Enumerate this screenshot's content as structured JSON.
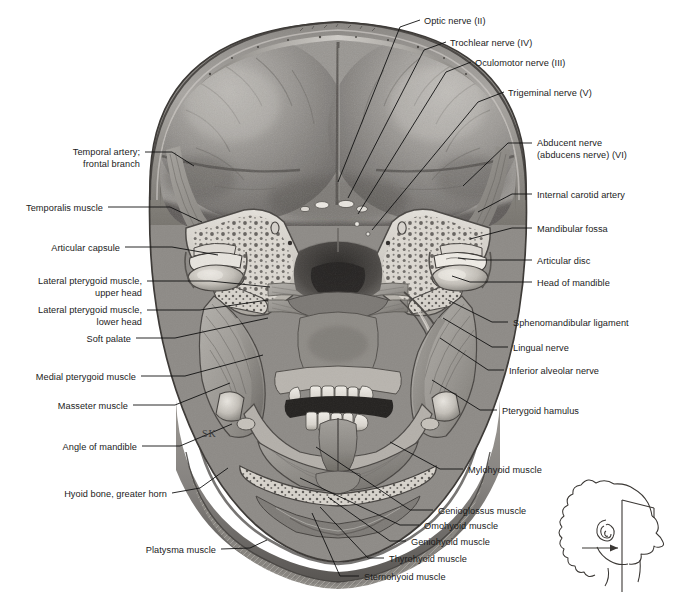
{
  "figure": {
    "background_color": "#ffffff",
    "artist_signature": "SK",
    "width": 676,
    "height": 594
  },
  "labels_left": [
    {
      "id": "temporal-artery-frontal-branch",
      "lines": [
        "Temporal artery;",
        "frontal branch"
      ],
      "text_x": 140,
      "text_y": 147,
      "leader": [
        [
          145,
          152
        ],
        [
          172,
          152
        ],
        [
          194,
          166
        ]
      ]
    },
    {
      "id": "temporalis-muscle",
      "lines": [
        "Temporalis muscle"
      ],
      "text_x": 103,
      "text_y": 203,
      "leader": [
        [
          108,
          207
        ],
        [
          170,
          207
        ],
        [
          202,
          222
        ]
      ]
    },
    {
      "id": "articular-capsule",
      "lines": [
        "Articular capsule"
      ],
      "text_x": 120,
      "text_y": 243,
      "leader": [
        [
          125,
          247
        ],
        [
          172,
          247
        ],
        [
          218,
          255
        ]
      ]
    },
    {
      "id": "lateral-pterygoid-muscle-upper-head",
      "lines": [
        "Lateral pterygoid muscle,",
        "upper head"
      ],
      "text_x": 142,
      "text_y": 276,
      "leader": [
        [
          147,
          281
        ],
        [
          210,
          281
        ],
        [
          270,
          287
        ]
      ]
    },
    {
      "id": "lateral-pterygoid-muscle-lower-head",
      "lines": [
        "Lateral pterygoid muscle,",
        "lower head"
      ],
      "text_x": 142,
      "text_y": 305,
      "leader": [
        [
          147,
          310
        ],
        [
          200,
          310
        ],
        [
          268,
          300
        ]
      ]
    },
    {
      "id": "soft-palate",
      "lines": [
        "Soft palate"
      ],
      "text_x": 131,
      "text_y": 334,
      "leader": [
        [
          136,
          338
        ],
        [
          175,
          338
        ],
        [
          268,
          318
        ]
      ]
    },
    {
      "id": "medial-pterygoid-muscle",
      "lines": [
        "Medial pterygoid muscle"
      ],
      "text_x": 136,
      "text_y": 372,
      "leader": [
        [
          141,
          376
        ],
        [
          185,
          376
        ],
        [
          263,
          355
        ]
      ]
    },
    {
      "id": "masseter-muscle",
      "lines": [
        "Masseter muscle"
      ],
      "text_x": 128,
      "text_y": 401,
      "leader": [
        [
          133,
          405
        ],
        [
          175,
          405
        ],
        [
          230,
          383
        ]
      ]
    },
    {
      "id": "angle-of-mandible",
      "lines": [
        "Angle of mandible"
      ],
      "text_x": 137,
      "text_y": 442,
      "leader": [
        [
          142,
          446
        ],
        [
          180,
          446
        ],
        [
          232,
          424
        ]
      ]
    },
    {
      "id": "hyoid-bone-greater-horn",
      "lines": [
        "Hyoid bone, greater horn"
      ],
      "text_x": 167,
      "text_y": 489,
      "leader": [
        [
          172,
          493
        ],
        [
          200,
          488
        ],
        [
          228,
          468
        ]
      ]
    },
    {
      "id": "platysma-muscle",
      "lines": [
        "Platysma muscle"
      ],
      "text_x": 216,
      "text_y": 545,
      "leader": [
        [
          221,
          549
        ],
        [
          250,
          548
        ],
        [
          267,
          540
        ]
      ]
    }
  ],
  "labels_top": [
    {
      "id": "optic-nerve-ii",
      "lines": [
        "Optic nerve (II)",
        ""
      ],
      "text_x": 424,
      "text_y": 16,
      "leader": [
        [
          420,
          20
        ],
        [
          400,
          27
        ],
        [
          338,
          182
        ]
      ]
    },
    {
      "id": "trochlear-nerve-iv",
      "lines": [
        "Trochlear nerve (IV)"
      ],
      "text_x": 450,
      "text_y": 38,
      "leader": [
        [
          446,
          42
        ],
        [
          424,
          50
        ],
        [
          348,
          198
        ]
      ]
    },
    {
      "id": "oculomotor-nerve-iii",
      "lines": [
        "Oculomotor nerve (III)"
      ],
      "text_x": 475,
      "text_y": 58,
      "leader": [
        [
          471,
          62
        ],
        [
          446,
          72
        ],
        [
          358,
          214
        ]
      ]
    },
    {
      "id": "trigeminal-nerve-v",
      "lines": [
        "Trigeminal nerve (V)"
      ],
      "text_x": 508,
      "text_y": 88,
      "leader": [
        [
          504,
          92
        ],
        [
          478,
          102
        ],
        [
          372,
          230
        ]
      ]
    }
  ],
  "labels_right": [
    {
      "id": "abducent-nerve-vi",
      "lines": [
        "Abducent nerve",
        "(abducens nerve) (VI)"
      ],
      "text_x": 537,
      "text_y": 138,
      "leader": [
        [
          532,
          143
        ],
        [
          508,
          143
        ],
        [
          463,
          186
        ]
      ]
    },
    {
      "id": "internal-carotid-artery",
      "lines": [
        "Internal carotid artery"
      ],
      "text_x": 537,
      "text_y": 190,
      "leader": [
        [
          532,
          194
        ],
        [
          512,
          194
        ],
        [
          478,
          212
        ]
      ]
    },
    {
      "id": "mandibular-fossa",
      "lines": [
        "Mandibular fossa"
      ],
      "text_x": 537,
      "text_y": 224,
      "leader": [
        [
          532,
          228
        ],
        [
          512,
          228
        ],
        [
          470,
          239
        ]
      ]
    },
    {
      "id": "articular-disc",
      "lines": [
        "Articular disc"
      ],
      "text_x": 537,
      "text_y": 256,
      "leader": [
        [
          532,
          260
        ],
        [
          478,
          260
        ],
        [
          458,
          258
        ]
      ]
    },
    {
      "id": "head-of-mandible",
      "lines": [
        "Head of mandible"
      ],
      "text_x": 537,
      "text_y": 278,
      "leader": [
        [
          532,
          282
        ],
        [
          470,
          282
        ],
        [
          452,
          276
        ]
      ]
    },
    {
      "id": "sphenomandibular-ligament",
      "lines": [
        "Sphenomandibular ligament"
      ],
      "text_x": 513,
      "text_y": 318,
      "leader": [
        [
          508,
          322
        ],
        [
          492,
          322
        ],
        [
          448,
          300
        ]
      ]
    },
    {
      "id": "lingual-nerve",
      "lines": [
        "Lingual nerve"
      ],
      "text_x": 513,
      "text_y": 343,
      "leader": [
        [
          508,
          347
        ],
        [
          492,
          347
        ],
        [
          443,
          318
        ]
      ]
    },
    {
      "id": "inferior-alveolar-nerve",
      "lines": [
        "Inferior alveolar nerve"
      ],
      "text_x": 509,
      "text_y": 366,
      "leader": [
        [
          504,
          370
        ],
        [
          488,
          370
        ],
        [
          440,
          338
        ]
      ]
    },
    {
      "id": "pterygoid-hamulus",
      "lines": [
        "Pterygoid hamulus"
      ],
      "text_x": 502,
      "text_y": 406,
      "leader": [
        [
          497,
          410
        ],
        [
          480,
          410
        ],
        [
          432,
          380
        ]
      ]
    },
    {
      "id": "mylohyoid-muscle",
      "lines": [
        "Mylohyoid muscle"
      ],
      "text_x": 468,
      "text_y": 465,
      "leader": [
        [
          463,
          469
        ],
        [
          440,
          469
        ],
        [
          390,
          442
        ]
      ]
    }
  ],
  "labels_bottom": [
    {
      "id": "genioglossus-muscle",
      "lines": [
        "Genioglossus muscle"
      ],
      "text_x": 438,
      "text_y": 506,
      "leader": [
        [
          433,
          510
        ],
        [
          410,
          510
        ],
        [
          316,
          447
        ]
      ]
    },
    {
      "id": "omohyoid-muscle",
      "lines": [
        "Omohyoid muscle"
      ],
      "text_x": 424,
      "text_y": 521,
      "leader": [
        [
          419,
          525
        ],
        [
          400,
          525
        ],
        [
          300,
          478
        ]
      ]
    },
    {
      "id": "geniohyoid-muscle",
      "lines": [
        "Geniohyoid muscle"
      ],
      "text_x": 411,
      "text_y": 537,
      "leader": [
        [
          406,
          541
        ],
        [
          390,
          541
        ],
        [
          328,
          497
        ]
      ]
    },
    {
      "id": "thyrohyoid-muscle",
      "lines": [
        "Thyrohyoid muscle"
      ],
      "text_x": 389,
      "text_y": 554,
      "leader": [
        [
          384,
          558
        ],
        [
          368,
          558
        ],
        [
          320,
          507
        ]
      ]
    },
    {
      "id": "sternohyoid-muscle",
      "lines": [
        "Sternohyoid muscle"
      ],
      "text_x": 364,
      "text_y": 572,
      "leader": [
        [
          359,
          576
        ],
        [
          340,
          576
        ],
        [
          312,
          513
        ]
      ]
    }
  ],
  "inset": {
    "id": "orientation-inset",
    "description": "Lateral head profile with vertical section plane and arrow showing direction of view",
    "x": 570,
    "y": 478,
    "width": 100,
    "height": 110
  }
}
